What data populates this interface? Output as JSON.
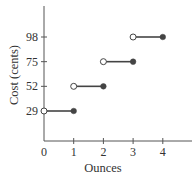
{
  "chart_data": {
    "type": "line",
    "subtype": "step",
    "title": "",
    "xlabel": "Ounces",
    "ylabel": "Cost (cents)",
    "xlim": [
      0,
      4.9
    ],
    "ylim": [
      0,
      130
    ],
    "grid": false,
    "legend": null,
    "x_ticks": [
      "0",
      "1",
      "2",
      "3",
      "4"
    ],
    "y_ticks": [
      "29",
      "52",
      "75",
      "98"
    ],
    "segments": [
      {
        "x_start": 0,
        "x_end": 1,
        "y": 29,
        "start": "open",
        "end": "closed"
      },
      {
        "x_start": 1,
        "x_end": 2,
        "y": 52,
        "start": "open",
        "end": "closed"
      },
      {
        "x_start": 2,
        "x_end": 3,
        "y": 75,
        "start": "open",
        "end": "closed"
      },
      {
        "x_start": 3,
        "x_end": 4,
        "y": 98,
        "start": "open",
        "end": "closed"
      }
    ],
    "colors": {
      "axis": "#555555",
      "line": "#444444",
      "filled_point": "#444444",
      "open_point_fill": "#ffffff"
    }
  }
}
